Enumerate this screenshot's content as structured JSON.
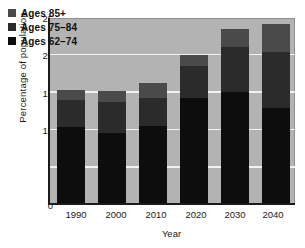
{
  "chart_data": {
    "type": "bar",
    "subtype": "stacked",
    "title": "",
    "xlabel": "Year",
    "ylabel": "Percentage of population",
    "categories": [
      "1990",
      "2000",
      "2010",
      "2020",
      "2030",
      "2040"
    ],
    "series": [
      {
        "name": "Ages 62–74",
        "color": "#0d0d0d",
        "values": [
          10.1,
          9.3,
          10.3,
          14.1,
          14.8,
          12.7
        ]
      },
      {
        "name": "Ages 75–84",
        "color": "#2b2b2b",
        "values": [
          3.7,
          4.2,
          3.8,
          4.2,
          6.0,
          7.5
        ]
      },
      {
        "name": "Ages 85+",
        "color": "#4a4a4a",
        "values": [
          1.3,
          1.5,
          2.0,
          1.5,
          2.4,
          3.7
        ]
      }
    ],
    "totals": [
      15.1,
      15.0,
      16.1,
      19.8,
      23.2,
      23.9
    ],
    "ylim": [
      0,
      25
    ],
    "yticks": [
      0,
      5,
      10,
      15,
      20,
      25
    ],
    "ytick_labels": [
      "0",
      "5",
      "10",
      "15",
      "20",
      "25"
    ],
    "grid": true,
    "grid_axis": "y",
    "grid_color": "#f2f2f2",
    "legend_position": "upper left",
    "legend_entries": [
      "Ages 85+",
      "Ages 75–84",
      "Ages 62–74"
    ],
    "plot_background": "#b3b3b3",
    "figure_background": "#ffffff",
    "axis_color": "#1a1a1a"
  },
  "legend": {
    "items": [
      {
        "label": "Ages 85+",
        "swatch": "legend-swatch-ages-85-plus"
      },
      {
        "label": "Ages 75–84",
        "swatch": "legend-swatch-ages-75-84"
      },
      {
        "label": "Ages 62–74",
        "swatch": "legend-swatch-ages-62-74"
      }
    ]
  },
  "axes": {
    "y_title": "Percentage of population",
    "x_title": "Year",
    "y_ticks": [
      "25",
      "20",
      "15",
      "10",
      "5",
      "0"
    ],
    "x_ticks": [
      "1990",
      "2000",
      "2010",
      "2020",
      "2030",
      "2040"
    ]
  }
}
